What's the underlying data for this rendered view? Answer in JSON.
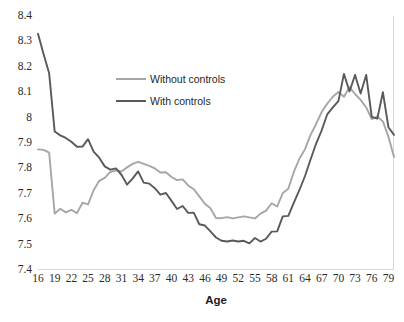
{
  "chart_data": {
    "type": "line",
    "title": "",
    "xlabel": "Age",
    "ylabel": "",
    "xlim": [
      16,
      80
    ],
    "ylim": [
      7.4,
      8.4
    ],
    "grid": false,
    "legend_position": "inside-upper-left",
    "x_tick_labels": [
      "16",
      "19",
      "22",
      "25",
      "28",
      "31",
      "34",
      "37",
      "40",
      "43",
      "46",
      "49",
      "52",
      "55",
      "58",
      "61",
      "64",
      "67",
      "70",
      "73",
      "76",
      "79"
    ],
    "y_tick_labels": [
      "8.4",
      "8.3",
      "8.2",
      "8.1",
      "8",
      "7.9",
      "7.8",
      "7.7",
      "7.6",
      "7.5",
      "7.4"
    ],
    "y_tick_values": [
      8.4,
      8.3,
      8.2,
      8.1,
      8.0,
      7.9,
      7.8,
      7.7,
      7.6,
      7.5,
      7.4
    ],
    "x": [
      16,
      17,
      18,
      19,
      20,
      21,
      22,
      23,
      24,
      25,
      26,
      27,
      28,
      29,
      30,
      31,
      32,
      33,
      34,
      35,
      36,
      37,
      38,
      39,
      40,
      41,
      42,
      43,
      44,
      45,
      46,
      47,
      48,
      49,
      50,
      51,
      52,
      53,
      54,
      55,
      56,
      57,
      58,
      59,
      60,
      61,
      62,
      63,
      64,
      65,
      66,
      67,
      68,
      69,
      70,
      71,
      72,
      73,
      74,
      75,
      76,
      77,
      78,
      79,
      80
    ],
    "series": [
      {
        "name": "Without controls",
        "color": "#a6a6a6",
        "values": [
          7.875,
          7.873,
          7.862,
          7.622,
          7.641,
          7.627,
          7.637,
          7.624,
          7.665,
          7.658,
          7.714,
          7.751,
          7.763,
          7.786,
          7.792,
          7.788,
          7.804,
          7.818,
          7.826,
          7.818,
          7.81,
          7.8,
          7.784,
          7.785,
          7.766,
          7.754,
          7.757,
          7.733,
          7.718,
          7.69,
          7.661,
          7.643,
          7.605,
          7.604,
          7.608,
          7.603,
          7.607,
          7.611,
          7.607,
          7.603,
          7.622,
          7.634,
          7.663,
          7.65,
          7.703,
          7.72,
          7.787,
          7.838,
          7.876,
          7.932,
          7.975,
          8.022,
          8.055,
          8.082,
          8.101,
          8.082,
          8.12,
          8.093,
          8.07,
          8.04,
          7.994,
          8.004,
          7.985,
          7.925,
          7.845
        ]
      },
      {
        "name": "With controls",
        "color": "#595959",
        "values": [
          8.33,
          8.25,
          8.175,
          7.945,
          7.93,
          7.92,
          7.905,
          7.885,
          7.886,
          7.915,
          7.866,
          7.842,
          7.808,
          7.795,
          7.8,
          7.775,
          7.736,
          7.76,
          7.788,
          7.744,
          7.74,
          7.722,
          7.697,
          7.703,
          7.672,
          7.64,
          7.652,
          7.625,
          7.626,
          7.58,
          7.575,
          7.552,
          7.528,
          7.515,
          7.512,
          7.516,
          7.512,
          7.515,
          7.505,
          7.526,
          7.512,
          7.523,
          7.551,
          7.552,
          7.611,
          7.613,
          7.665,
          7.715,
          7.77,
          7.835,
          7.898,
          7.95,
          8.013,
          8.04,
          8.065,
          8.172,
          8.103,
          8.168,
          8.095,
          8.168,
          8.003,
          7.996,
          8.1,
          7.962,
          7.932
        ]
      }
    ]
  },
  "axis": {
    "x_title": "Age"
  },
  "legend": {
    "items": [
      {
        "label": "Without controls",
        "color": "#a6a6a6"
      },
      {
        "label": "With controls",
        "color": "#595959"
      }
    ]
  }
}
